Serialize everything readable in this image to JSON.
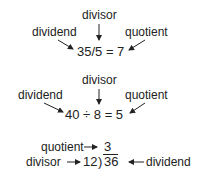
{
  "diagram1": {
    "divisor_label": "divisor",
    "dividend_label": "dividend",
    "quotient_label": "quotient",
    "equation": "35/5 = 7"
  },
  "diagram2": {
    "divisor_label": "divisor",
    "dividend_label": "dividend",
    "quotient_label": "quotient",
    "equation": "40 ÷ 8 = 5"
  },
  "diagram3": {
    "quotient_label": "quotient",
    "quotient_value": "3",
    "divisor_label": "divisor",
    "divisor_value": "12",
    "bracket": ")",
    "dividend_value": "36",
    "dividend_label": "dividend"
  }
}
